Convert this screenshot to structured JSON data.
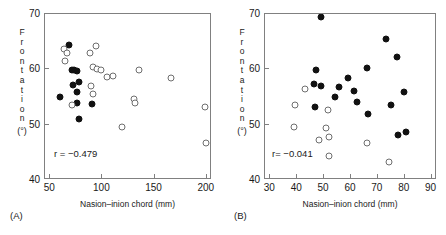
{
  "figure": {
    "panels": [
      {
        "tag": "(A)",
        "corr_text": "r = −0.479",
        "xlabel": "Nasion–inion chord (mm)",
        "ylabel_letters": [
          "F",
          "r",
          "o",
          "n",
          "t",
          "a",
          "t",
          "i",
          "o",
          "n"
        ],
        "ylabel_units": "(°)",
        "xticks": [
          50,
          100,
          150,
          200
        ],
        "yticks": [
          70,
          60,
          50,
          40
        ],
        "xlim": [
          45,
          205
        ],
        "ylim": [
          40,
          70
        ]
      },
      {
        "tag": "(B)",
        "corr_text": "r= −0.041",
        "xlabel": "Nasion–inion chord (mm)",
        "ylabel_letters": [
          "F",
          "r",
          "o",
          "n",
          "t",
          "a",
          "t",
          "i",
          "o",
          "n"
        ],
        "ylabel_units": "(°)",
        "xticks": [
          30,
          40,
          50,
          60,
          70,
          80,
          90
        ],
        "yticks": [
          70,
          60,
          50,
          40
        ],
        "xlim": [
          28,
          92
        ],
        "ylim": [
          40,
          70
        ]
      }
    ]
  },
  "chart_data": [
    {
      "type": "scatter",
      "panel": "A",
      "title": "",
      "xlabel": "Nasion–inion chord (mm)",
      "ylabel": "Frontation (°)",
      "xlim": [
        45,
        205
      ],
      "ylim": [
        40,
        70
      ],
      "xticks": [
        50,
        100,
        150,
        200
      ],
      "yticks": [
        40,
        50,
        60,
        70
      ],
      "grid": false,
      "legend": null,
      "annotations": [
        {
          "text": "r = −0.479",
          "x": 62,
          "y": 44.6
        }
      ],
      "series": [
        {
          "name": "filled",
          "marker": "filled-circle",
          "color": "#111111",
          "points": [
            [
              68.2,
              64.4
            ],
            [
              71.0,
              59.9
            ],
            [
              72.9,
              59.8
            ],
            [
              75.4,
              59.7
            ],
            [
              71.4,
              57.2
            ],
            [
              77.5,
              57.7
            ],
            [
              76.0,
              55.9
            ],
            [
              59.6,
              55.0
            ],
            [
              75.4,
              53.9
            ],
            [
              90.2,
              53.8
            ],
            [
              77.8,
              51.1
            ]
          ]
        },
        {
          "name": "open",
          "marker": "open-circle",
          "color": "#6e6e6e",
          "points": [
            [
              63.4,
              63.6
            ],
            [
              65.8,
              62.9
            ],
            [
              88.2,
              63.0
            ],
            [
              94.0,
              64.3
            ],
            [
              64.6,
              61.5
            ],
            [
              90.6,
              60.4
            ],
            [
              94.5,
              60.1
            ],
            [
              99.0,
              59.9
            ],
            [
              135.5,
              59.9
            ],
            [
              104.1,
              58.6
            ],
            [
              110.5,
              58.8
            ],
            [
              165.5,
              58.4
            ],
            [
              88.9,
              57.0
            ],
            [
              91.3,
              55.6
            ],
            [
              71.0,
              53.6
            ],
            [
              130.6,
              54.6
            ],
            [
              130.9,
              53.9
            ],
            [
              198.5,
              53.2
            ],
            [
              118.3,
              49.6
            ],
            [
              199.0,
              46.6
            ]
          ]
        }
      ]
    },
    {
      "type": "scatter",
      "panel": "B",
      "title": "",
      "xlabel": "Nasion–inion chord (mm)",
      "ylabel": "Frontation (°)",
      "xlim": [
        28,
        92
      ],
      "ylim": [
        40,
        70
      ],
      "xticks": [
        30,
        40,
        50,
        60,
        70,
        80,
        90
      ],
      "yticks": [
        40,
        50,
        60,
        70
      ],
      "grid": false,
      "legend": null,
      "annotations": [
        {
          "text": "r= −0.041",
          "x": 33.5,
          "y": 44.6
        }
      ],
      "series": [
        {
          "name": "filled",
          "marker": "filled-circle",
          "color": "#111111",
          "points": [
            [
              48.8,
              69.4
            ],
            [
              73.0,
              65.5
            ],
            [
              77.1,
              62.3
            ],
            [
              46.9,
              59.9
            ],
            [
              66.1,
              60.3
            ],
            [
              58.9,
              58.4
            ],
            [
              46.4,
              57.4
            ],
            [
              49.0,
              56.9
            ],
            [
              55.6,
              56.8
            ],
            [
              61.3,
              56.0
            ],
            [
              79.9,
              55.9
            ],
            [
              54.2,
              55.0
            ],
            [
              62.4,
              54.1
            ],
            [
              46.7,
              53.2
            ],
            [
              74.9,
              53.5
            ],
            [
              66.3,
              52.0
            ],
            [
              77.6,
              48.2
            ],
            [
              80.4,
              48.6
            ]
          ]
        },
        {
          "name": "open",
          "marker": "open-circle",
          "color": "#6e6e6e",
          "points": [
            [
              42.8,
              56.5
            ],
            [
              39.0,
              53.5
            ],
            [
              51.6,
              52.6
            ],
            [
              38.9,
              49.5
            ],
            [
              50.6,
              49.4
            ],
            [
              48.2,
              47.3
            ],
            [
              51.9,
              47.8
            ],
            [
              66.1,
              46.6
            ],
            [
              51.8,
              44.4
            ],
            [
              74.0,
              43.2
            ]
          ]
        }
      ]
    }
  ]
}
